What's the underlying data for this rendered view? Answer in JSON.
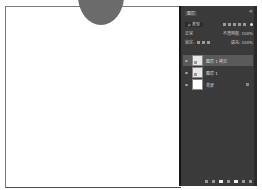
{
  "canvas": {
    "background": "#ffffff",
    "shape_color": "#6b6b6b"
  },
  "layers_panel": {
    "tab_label": "图层",
    "menu_icon": "panel-menu-icon",
    "filter": {
      "kind_label": "ρ 类型",
      "filter_icons": [
        "pixel-filter-icon",
        "adjustment-filter-icon",
        "type-filter-icon",
        "shape-filter-icon",
        "smart-object-filter-icon"
      ]
    },
    "blend_mode": "正常",
    "opacity_label": "不透明度: 100%",
    "lock_label": "锁定:",
    "fill_label": "填充: 100%",
    "lock_row2": "图层 1 拷贝",
    "layers": [
      {
        "name": "图层 1 拷贝",
        "selected": true,
        "visible": true
      },
      {
        "name": "图层 1",
        "selected": false,
        "visible": true
      },
      {
        "name": "背景",
        "selected": false,
        "visible": true,
        "locked": true
      }
    ],
    "footer_icons": [
      "link-icon",
      "fx-icon",
      "mask-icon",
      "adjustment-icon",
      "group-icon",
      "new-layer-icon",
      "delete-icon"
    ],
    "colors": {
      "panel_bg": "#3a3a3a",
      "selected_row": "#5a5a5a",
      "text": "#cfcfcf"
    }
  }
}
